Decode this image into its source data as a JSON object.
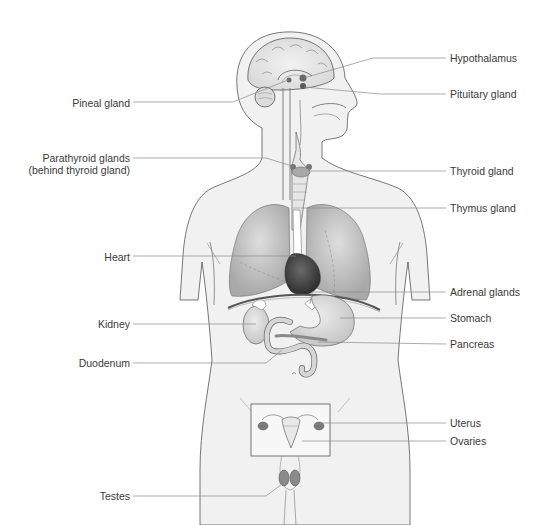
{
  "diagram": {
    "labels_left": [
      {
        "id": "pineal",
        "text": "Pineal gland",
        "x": 62,
        "y": 97
      },
      {
        "id": "parathyroid",
        "text": "Parathyroid glands",
        "x": 43,
        "y": 152
      },
      {
        "id": "parathyroid_note",
        "text": "(behind thyroid gland)",
        "x": 29,
        "y": 164
      },
      {
        "id": "heart",
        "text": "Heart",
        "x": 101,
        "y": 251
      },
      {
        "id": "kidney",
        "text": "Kidney",
        "x": 95,
        "y": 318
      },
      {
        "id": "duodenum",
        "text": "Duodenum",
        "x": 77,
        "y": 357
      },
      {
        "id": "testes",
        "text": "Testes",
        "x": 100,
        "y": 490
      }
    ],
    "labels_right": [
      {
        "id": "hypothalamus",
        "text": "Hypothalamus",
        "x": 450,
        "y": 53
      },
      {
        "id": "pituitary",
        "text": "Pituitary gland",
        "x": 450,
        "y": 89
      },
      {
        "id": "thyroid",
        "text": "Thyroid gland",
        "x": 450,
        "y": 166
      },
      {
        "id": "thymus",
        "text": "Thymus gland",
        "x": 450,
        "y": 203
      },
      {
        "id": "adrenal",
        "text": "Adrenal glands",
        "x": 450,
        "y": 287
      },
      {
        "id": "stomach",
        "text": "Stomach",
        "x": 450,
        "y": 313
      },
      {
        "id": "pancreas",
        "text": "Pancreas",
        "x": 450,
        "y": 339
      },
      {
        "id": "uterus",
        "text": "Uterus",
        "x": 450,
        "y": 418
      },
      {
        "id": "ovaries",
        "text": "Ovaries",
        "x": 450,
        "y": 436
      }
    ],
    "colors": {
      "outline": "#555555",
      "leader_line": "#8a8a8a",
      "skin_fill": "#f1f1f1",
      "lung_fill": "#bdbdbd",
      "heart_fill": "#4a4a4a",
      "organ_fill": "#d6d6d6",
      "gland_fill": "#7a7a7a",
      "text": "#3a3a3a"
    }
  }
}
